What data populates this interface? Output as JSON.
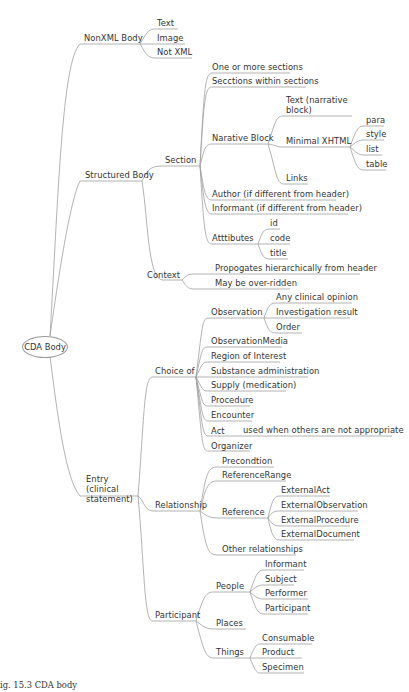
{
  "diagram": {
    "type": "mind-map",
    "line_color": "#9a9a9a",
    "root": {
      "label": "CDA Body"
    },
    "nodes": {
      "nonxml": {
        "label": "NonXML Body",
        "children": {
          "text": "Text",
          "image": "Image",
          "notxml": "Not XML"
        }
      },
      "structured": {
        "label": "Structured Body",
        "section": {
          "label": "Section",
          "one_or_more": "One or more sections",
          "within": "Secctions within sections",
          "narrative": {
            "label": "Narative Block",
            "text": "Text (narrative block)",
            "xhtml": {
              "label": "Minimal XHTML",
              "para": "para",
              "style": "style",
              "list": "list",
              "table": "table"
            },
            "links": "Links"
          },
          "author": "Author (if different from header)",
          "informant": "Informant (if different from header)",
          "attributes": {
            "label": "Atttibutes",
            "id": "id",
            "code": "code",
            "title": "title"
          }
        },
        "context": {
          "label": "Context",
          "propagates": "Propogates hierarchically from header",
          "override": "May be over-ridden"
        }
      },
      "entry": {
        "label": "Entry (clinical statement)",
        "choice": {
          "label": "Choice of",
          "observation": {
            "label": "Observation",
            "opinion": "Any clinical opinion",
            "investigation": "Investigation result",
            "order": "Order"
          },
          "items": [
            "ObservationMedia",
            "Region of Interest",
            "Substance administration",
            "Supply (medication)",
            "Procedure",
            "Encounter"
          ],
          "act": {
            "label": "Act",
            "note": "used when others are not appropriate"
          },
          "organizer": "Organizer"
        },
        "relationship": {
          "label": "Relationship",
          "precondition": "Precondtion",
          "referencerange": "ReferenceRange",
          "reference": {
            "label": "Reference",
            "items": [
              "ExternalAct",
              "ExternalObservation",
              "ExternalProcedure",
              "ExternalDocument"
            ]
          },
          "other": "Other relationships"
        },
        "participant": {
          "label": "Participant",
          "people": {
            "label": "People",
            "items": [
              "Informant",
              "Subject",
              "Performer",
              "Participant"
            ]
          },
          "places": "Places",
          "things": {
            "label": "Things",
            "items": [
              "Consumable",
              "Product",
              "Specimen"
            ]
          }
        }
      }
    },
    "caption": "ig. 15.3  CDA body"
  }
}
